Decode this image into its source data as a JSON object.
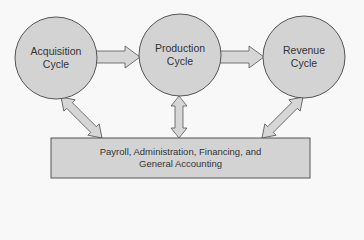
{
  "diagram": {
    "colors": {
      "background": "#f8f8f8",
      "shape_fill": "#d3d3d3",
      "shape_stroke": "#555555",
      "arrow_fill": "#d6d6d6",
      "text": "#333333"
    },
    "nodes": [
      {
        "id": "acquisition",
        "shape": "circle",
        "line1": "Acquisition",
        "line2": "Cycle"
      },
      {
        "id": "production",
        "shape": "circle",
        "line1": "Production",
        "line2": "Cycle"
      },
      {
        "id": "revenue",
        "shape": "circle",
        "line1": "Revenue",
        "line2": "Cycle"
      }
    ],
    "box": {
      "id": "payroll",
      "shape": "rectangle",
      "line1": "Payroll, Administration, Financing, and",
      "line2": "General Accounting"
    },
    "edges": [
      {
        "from": "acquisition",
        "to": "production",
        "type": "single-arrow"
      },
      {
        "from": "production",
        "to": "revenue",
        "type": "single-arrow"
      },
      {
        "from": "acquisition",
        "to": "payroll",
        "type": "double-arrow"
      },
      {
        "from": "production",
        "to": "payroll",
        "type": "double-arrow"
      },
      {
        "from": "revenue",
        "to": "payroll",
        "type": "double-arrow"
      }
    ]
  }
}
